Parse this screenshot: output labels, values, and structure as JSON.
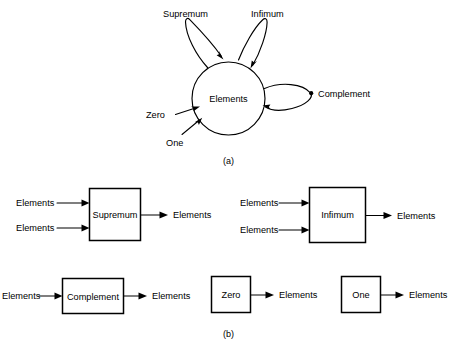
{
  "figure": {
    "background_color": "#ffffff",
    "line_color": "#000000",
    "panels": [
      {
        "caption": "(a)",
        "description": "state-circle with self loops"
      },
      {
        "caption": "(b)",
        "description": "block diagram operators"
      }
    ]
  },
  "panel_a": {
    "caption": "(a)",
    "node_label": "Elements",
    "loops": [
      {
        "name": "supremum-loop",
        "label": "Supremum"
      },
      {
        "name": "infimum-loop",
        "label": "Infimum"
      },
      {
        "name": "complement-loop",
        "label": "Complement"
      }
    ],
    "inputs": [
      {
        "name": "zero-input",
        "label": "Zero"
      },
      {
        "name": "one-input",
        "label": "One"
      }
    ]
  },
  "panel_b": {
    "caption": "(b)",
    "blocks": [
      {
        "name": "supremum-block",
        "label": "Supremum",
        "inputs": [
          "Elements",
          "Elements"
        ],
        "outputs": [
          "Elements"
        ]
      },
      {
        "name": "infimum-block",
        "label": "Infimum",
        "inputs": [
          "Elements",
          "Elements"
        ],
        "outputs": [
          "Elements"
        ]
      },
      {
        "name": "complement-block",
        "label": "Complement",
        "inputs": [
          "Elements"
        ],
        "outputs": [
          "Elements"
        ]
      },
      {
        "name": "zero-block",
        "label": "Zero",
        "inputs": [],
        "outputs": [
          "Elements"
        ]
      },
      {
        "name": "one-block",
        "label": "One",
        "inputs": [],
        "outputs": [
          "Elements"
        ]
      }
    ]
  }
}
